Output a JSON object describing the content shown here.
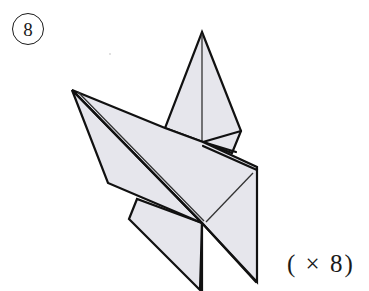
{
  "diagram": {
    "step_number": "8",
    "repeat_label": "( × 8)",
    "colors": {
      "paper_fill": "#e6e6ec",
      "line": "#111111",
      "background": "#ffffff"
    }
  }
}
